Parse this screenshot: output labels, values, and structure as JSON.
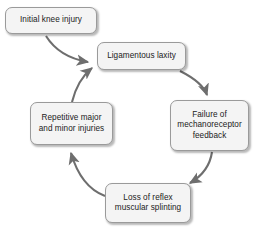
{
  "diagram": {
    "type": "cycle-flowchart",
    "canvas": {
      "width": 258,
      "height": 229,
      "background": "#ffffff"
    },
    "style": {
      "node_fill": "#f4f4f4",
      "node_border": "#9a9a9a",
      "node_text": "#222222",
      "arrow_color": "#6e6e6e"
    },
    "nodes": [
      {
        "id": "initial-knee-injury",
        "label": "Initial knee injury",
        "x": 5,
        "y": 7,
        "w": 92,
        "h": 27
      },
      {
        "id": "ligamentous-laxity",
        "label": "Ligamentous laxity",
        "x": 97,
        "y": 42,
        "w": 89,
        "h": 28
      },
      {
        "id": "failure-of-mechanoreceptor-feedback",
        "label": "Failure of\nmechanoreceptor\nfeedback",
        "x": 170,
        "y": 100,
        "w": 79,
        "h": 51
      },
      {
        "id": "loss-of-reflex-muscular-splinting",
        "label": "Loss of reflex\nmuscular splinting",
        "x": 105,
        "y": 183,
        "w": 86,
        "h": 40
      },
      {
        "id": "repetitive-major-and-minor-injuries",
        "label": "Repetitive major\nand minor injuries",
        "x": 30,
        "y": 102,
        "w": 83,
        "h": 43
      }
    ],
    "edges": [
      {
        "id": "edge-initial-to-laxity",
        "from": "initial-knee-injury",
        "to": "ligamentous-laxity"
      },
      {
        "id": "edge-laxity-to-failure",
        "from": "ligamentous-laxity",
        "to": "failure-of-mechanoreceptor-feedback"
      },
      {
        "id": "edge-failure-to-loss",
        "from": "failure-of-mechanoreceptor-feedback",
        "to": "loss-of-reflex-muscular-splinting"
      },
      {
        "id": "edge-loss-to-repetitive",
        "from": "loss-of-reflex-muscular-splinting",
        "to": "repetitive-major-and-minor-injuries"
      },
      {
        "id": "edge-repetitive-to-laxity",
        "from": "repetitive-major-and-minor-injuries",
        "to": "ligamentous-laxity"
      }
    ]
  }
}
